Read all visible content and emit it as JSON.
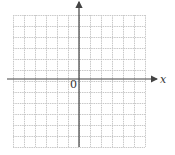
{
  "diagram": {
    "type": "coordinate-grid",
    "x_axis_label": "x",
    "origin_label": "0",
    "grid": {
      "columns": 12,
      "rows": 12,
      "left": 13,
      "top": 15,
      "cell": 11,
      "line_color": "#c8c8c8"
    },
    "axes": {
      "color": "#444444",
      "origin_x": 79,
      "origin_y": 79,
      "x_start": 7,
      "x_end": 157,
      "y_start": 2,
      "y_end": 147
    }
  }
}
